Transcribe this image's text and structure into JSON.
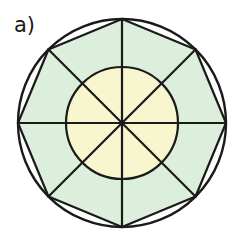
{
  "figure": {
    "panel_label": "a)",
    "type": "geometric-diagram",
    "background_color": "#FFFFFF",
    "stroke_color": "#1A1A1A",
    "stroke_width": 2.2,
    "center": {
      "x": 122,
      "y": 123
    },
    "outer_circle": {
      "name": "outer-circle",
      "radius": 104,
      "fill": "#FFFFFF",
      "stroke": "#1A1A1A"
    },
    "inner_circle": {
      "name": "inner-circle",
      "radius": 56,
      "fill": "#F8F6CE",
      "stroke": "#1A1A1A"
    },
    "blade": {
      "name": "pinwheel-blade",
      "count": 8,
      "fill": "#DCEFDC",
      "stroke": "#1A1A1A",
      "span_degrees": 45,
      "base_offset_degrees": 90,
      "inner_vertex_radius": 33
    },
    "spokes": {
      "name": "radial-spokes",
      "count": 8,
      "step_degrees": 45,
      "radius": 104,
      "stroke": "#1A1A1A"
    },
    "vertex_angles_degrees": [
      0,
      45,
      90,
      135,
      180,
      225,
      270,
      315
    ],
    "colors": {
      "pale_yellow": "#F8F6CE",
      "pale_green": "#DCEFDC",
      "outline_black": "#1A1A1A",
      "white": "#FFFFFF"
    }
  }
}
